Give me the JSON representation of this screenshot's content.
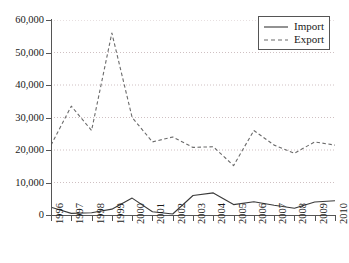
{
  "chart_data": {
    "type": "line",
    "title": "",
    "xlabel": "",
    "ylabel": "",
    "grid": true,
    "legend_position": "top-right",
    "x": [
      1996,
      1997,
      1998,
      1999,
      2000,
      2001,
      2002,
      2003,
      2004,
      2005,
      2006,
      2007,
      2008,
      2009,
      2010
    ],
    "xtick_labels": [
      "1996",
      "1997",
      "1998",
      "1999",
      "2000",
      "2001",
      "2002",
      "2003",
      "2004",
      "2005",
      "2006",
      "2007",
      "2008",
      "2009",
      "2010"
    ],
    "ylim": [
      0,
      60000
    ],
    "ytick_values": [
      0,
      10000,
      20000,
      30000,
      40000,
      50000,
      60000
    ],
    "ytick_labels": [
      "0",
      "10,000",
      "20,000",
      "30,000",
      "40,000",
      "50,000",
      "60,000"
    ],
    "xlim": [
      1996,
      2010
    ],
    "series": [
      {
        "name": "Import",
        "style": "solid",
        "color": "#3a3a3a",
        "values": [
          2400,
          500,
          700,
          1800,
          5200,
          1000,
          300,
          6000,
          6800,
          3200,
          4100,
          3000,
          2100,
          4000,
          4400
        ]
      },
      {
        "name": "Export",
        "style": "dashed",
        "color": "#6b6b6b",
        "values": [
          21500,
          33500,
          26000,
          56000,
          30000,
          22500,
          24000,
          20800,
          21000,
          15200,
          26000,
          21500,
          19000,
          22500,
          21500
        ]
      }
    ]
  },
  "legend": {
    "items": [
      {
        "label": "Import",
        "style": "solid"
      },
      {
        "label": "Export",
        "style": "dashed"
      }
    ]
  }
}
